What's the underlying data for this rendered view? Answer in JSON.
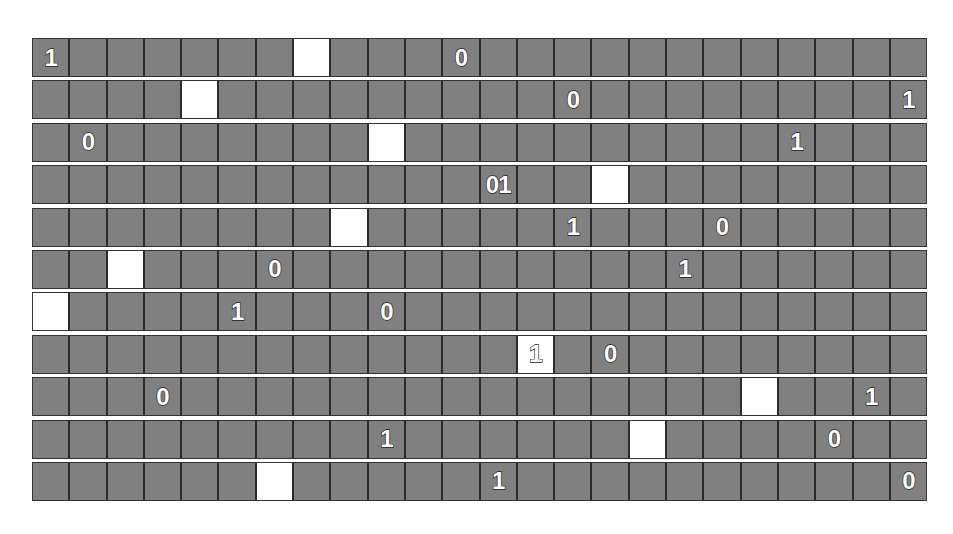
{
  "board": {
    "rows": 11,
    "cols": 24,
    "colors": {
      "cell": "#808080",
      "highlight": "#ffffff",
      "border": "#2a2a2a",
      "text": "#ffffff"
    },
    "grid": [
      [
        {
          "c": 0,
          "v": "1"
        },
        {
          "c": 7,
          "w": true
        },
        {
          "c": 11,
          "v": "0"
        }
      ],
      [
        {
          "c": 4,
          "w": true
        },
        {
          "c": 14,
          "v": "0"
        },
        {
          "c": 23,
          "v": "1"
        }
      ],
      [
        {
          "c": 1,
          "v": "0"
        },
        {
          "c": 9,
          "w": true
        },
        {
          "c": 20,
          "v": "1"
        }
      ],
      [
        {
          "c": 12,
          "v": "01"
        },
        {
          "c": 15,
          "w": true
        }
      ],
      [
        {
          "c": 8,
          "w": true
        },
        {
          "c": 14,
          "v": "1"
        },
        {
          "c": 18,
          "v": "0"
        }
      ],
      [
        {
          "c": 2,
          "w": true
        },
        {
          "c": 6,
          "v": "0"
        },
        {
          "c": 17,
          "v": "1"
        }
      ],
      [
        {
          "c": 0,
          "w": true
        },
        {
          "c": 5,
          "v": "1"
        },
        {
          "c": 9,
          "v": "0"
        }
      ],
      [
        {
          "c": 13,
          "w": true,
          "v": "1"
        },
        {
          "c": 15,
          "v": "0"
        }
      ],
      [
        {
          "c": 3,
          "v": "0"
        },
        {
          "c": 19,
          "w": true
        },
        {
          "c": 22,
          "v": "1"
        }
      ],
      [
        {
          "c": 9,
          "v": "1"
        },
        {
          "c": 16,
          "w": true
        },
        {
          "c": 21,
          "v": "0"
        }
      ],
      [
        {
          "c": 6,
          "w": true
        },
        {
          "c": 12,
          "v": "1"
        },
        {
          "c": 23,
          "v": "0"
        }
      ]
    ]
  }
}
